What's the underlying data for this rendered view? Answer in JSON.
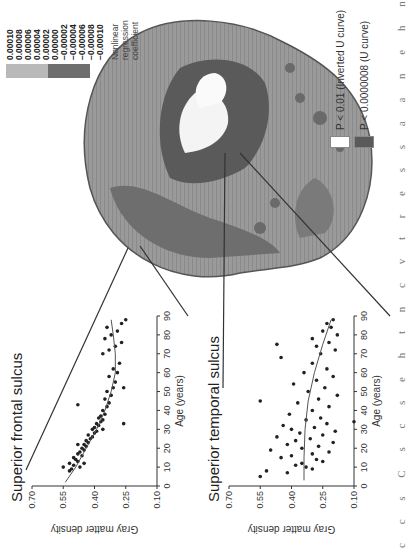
{
  "figure": {
    "edge_text": "c c s C s c s e h t n c v t r e s s a a n e h n a d",
    "colorbar": {
      "title": "Nonlinear regression coefficient",
      "ticks": [
        "0.00010",
        "0.00008",
        "0.00006",
        "0.00004",
        "0.00002",
        "0.00000",
        "−0.00002",
        "−0.00004",
        "−0.00006",
        "−0.00008",
        "−0.00010"
      ],
      "colors": {
        "positive": "#b9b9b9",
        "negative": "#6e6e6e"
      }
    },
    "legend": [
      {
        "label": "P < 0.01 (Inverted U curve)",
        "color": "#ffffff"
      },
      {
        "label": "P < 0.0000008 (U curve)",
        "color": "#5a5a5a"
      }
    ],
    "panels": {
      "frontal": {
        "title": "Superior frontal sulcus"
      },
      "temporal": {
        "title": "Superior temporal sulcus"
      }
    }
  },
  "chart_data": [
    {
      "type": "scatter",
      "title": "Superior frontal sulcus",
      "xlabel": "Age (years)",
      "ylabel": "Gray matter density",
      "xlim": [
        0,
        90
      ],
      "ylim": [
        0.1,
        0.7
      ],
      "xticks": [
        0,
        10,
        20,
        30,
        40,
        50,
        60,
        70,
        80,
        90
      ],
      "yticks": [
        0.1,
        0.25,
        0.4,
        0.55,
        0.7
      ],
      "fit": {
        "type": "quadratic",
        "points": [
          [
            2,
            0.54
          ],
          [
            10,
            0.49
          ],
          [
            20,
            0.44
          ],
          [
            30,
            0.39
          ],
          [
            40,
            0.35
          ],
          [
            50,
            0.32
          ],
          [
            60,
            0.3
          ],
          [
            70,
            0.3
          ],
          [
            80,
            0.31
          ],
          [
            88,
            0.32
          ]
        ]
      },
      "points": [
        [
          10,
          0.55
        ],
        [
          8,
          0.52
        ],
        [
          9,
          0.51
        ],
        [
          11,
          0.5
        ],
        [
          12,
          0.52
        ],
        [
          13,
          0.48
        ],
        [
          10,
          0.47
        ],
        [
          14,
          0.49
        ],
        [
          15,
          0.5
        ],
        [
          16,
          0.46
        ],
        [
          17,
          0.48
        ],
        [
          18,
          0.47
        ],
        [
          19,
          0.45
        ],
        [
          20,
          0.46
        ],
        [
          21,
          0.44
        ],
        [
          22,
          0.45
        ],
        [
          23,
          0.43
        ],
        [
          24,
          0.44
        ],
        [
          25,
          0.42
        ],
        [
          26,
          0.41
        ],
        [
          27,
          0.43
        ],
        [
          28,
          0.4
        ],
        [
          29,
          0.39
        ],
        [
          30,
          0.41
        ],
        [
          31,
          0.4
        ],
        [
          32,
          0.38
        ],
        [
          33,
          0.39
        ],
        [
          34,
          0.37
        ],
        [
          35,
          0.36
        ],
        [
          36,
          0.38
        ],
        [
          37,
          0.37
        ],
        [
          38,
          0.35
        ],
        [
          40,
          0.36
        ],
        [
          42,
          0.34
        ],
        [
          44,
          0.33
        ],
        [
          46,
          0.35
        ],
        [
          48,
          0.32
        ],
        [
          50,
          0.34
        ],
        [
          52,
          0.31
        ],
        [
          55,
          0.3
        ],
        [
          58,
          0.33
        ],
        [
          60,
          0.29
        ],
        [
          62,
          0.31
        ],
        [
          65,
          0.28
        ],
        [
          70,
          0.36
        ],
        [
          72,
          0.33
        ],
        [
          74,
          0.3
        ],
        [
          76,
          0.27
        ],
        [
          78,
          0.35
        ],
        [
          80,
          0.32
        ],
        [
          82,
          0.29
        ],
        [
          84,
          0.34
        ],
        [
          86,
          0.27
        ],
        [
          88,
          0.25
        ],
        [
          12,
          0.45
        ],
        [
          22,
          0.48
        ],
        [
          30,
          0.36
        ],
        [
          43,
          0.48
        ],
        [
          33,
          0.26
        ],
        [
          52,
          0.26
        ]
      ]
    },
    {
      "type": "scatter",
      "title": "Superior temporal sulcus",
      "xlabel": "Age (years)",
      "ylabel": "Gray matter density",
      "xlim": [
        0,
        90
      ],
      "ylim": [
        0.1,
        0.7
      ],
      "xticks": [
        0,
        10,
        20,
        30,
        40,
        50,
        60,
        70,
        80,
        90
      ],
      "yticks": [
        0.1,
        0.25,
        0.4,
        0.55,
        0.7
      ],
      "fit": {
        "type": "quadratic",
        "points": [
          [
            3,
            0.34
          ],
          [
            15,
            0.34
          ],
          [
            30,
            0.335
          ],
          [
            45,
            0.32
          ],
          [
            60,
            0.29
          ],
          [
            75,
            0.25
          ],
          [
            88,
            0.21
          ]
        ]
      },
      "points": [
        [
          5,
          0.55
        ],
        [
          8,
          0.52
        ],
        [
          10,
          0.33
        ],
        [
          12,
          0.35
        ],
        [
          14,
          0.28
        ],
        [
          15,
          0.45
        ],
        [
          16,
          0.4
        ],
        [
          17,
          0.3
        ],
        [
          18,
          0.22
        ],
        [
          19,
          0.5
        ],
        [
          20,
          0.35
        ],
        [
          21,
          0.27
        ],
        [
          22,
          0.42
        ],
        [
          23,
          0.2
        ],
        [
          24,
          0.38
        ],
        [
          25,
          0.31
        ],
        [
          26,
          0.47
        ],
        [
          27,
          0.25
        ],
        [
          28,
          0.36
        ],
        [
          29,
          0.19
        ],
        [
          30,
          0.4
        ],
        [
          31,
          0.29
        ],
        [
          32,
          0.44
        ],
        [
          33,
          0.23
        ],
        [
          34,
          0.1
        ],
        [
          35,
          0.33
        ],
        [
          36,
          0.26
        ],
        [
          38,
          0.41
        ],
        [
          40,
          0.3
        ],
        [
          42,
          0.22
        ],
        [
          44,
          0.37
        ],
        [
          45,
          0.55
        ],
        [
          46,
          0.27
        ],
        [
          48,
          0.18
        ],
        [
          50,
          0.32
        ],
        [
          52,
          0.24
        ],
        [
          54,
          0.39
        ],
        [
          56,
          0.28
        ],
        [
          58,
          0.2
        ],
        [
          60,
          0.34
        ],
        [
          62,
          0.23
        ],
        [
          65,
          0.3
        ],
        [
          68,
          0.45
        ],
        [
          70,
          0.26
        ],
        [
          72,
          0.19
        ],
        [
          74,
          0.28
        ],
        [
          75,
          0.47
        ],
        [
          76,
          0.22
        ],
        [
          78,
          0.3
        ],
        [
          80,
          0.18
        ],
        [
          82,
          0.25
        ],
        [
          84,
          0.21
        ],
        [
          86,
          0.23
        ],
        [
          88,
          0.2
        ],
        [
          9,
          0.3
        ],
        [
          11,
          0.38
        ],
        [
          13,
          0.25
        ],
        [
          7,
          0.42
        ]
      ]
    }
  ]
}
